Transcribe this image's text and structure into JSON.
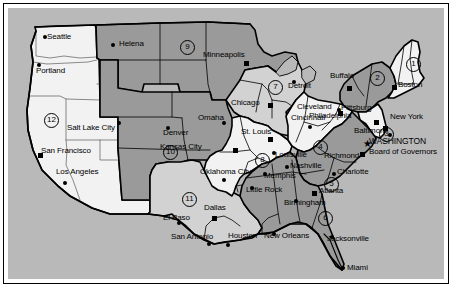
{
  "map": {
    "title": "Federal Reserve Districts of the United States",
    "colors": {
      "background": "#b9b9b9",
      "light_fill": "#f2f2f2",
      "mid_fill": "#d2d2d2",
      "dark_fill": "#9a9a9a",
      "outline": "#000000",
      "text": "#000000"
    },
    "districts": [
      {
        "number": "1",
        "x": 406,
        "y": 57,
        "name": "district-1-boston"
      },
      {
        "number": "2",
        "x": 370,
        "y": 71,
        "name": "district-2-new-york"
      },
      {
        "number": "3",
        "x": 379,
        "y": 127,
        "name": "district-3-philadelphia"
      },
      {
        "number": "4",
        "x": 313,
        "y": 140,
        "name": "district-4-cleveland"
      },
      {
        "number": "5",
        "x": 324,
        "y": 177,
        "name": "district-5-richmond"
      },
      {
        "number": "6",
        "x": 318,
        "y": 211,
        "name": "district-6-atlanta"
      },
      {
        "number": "7",
        "x": 268,
        "y": 80,
        "name": "district-7-chicago"
      },
      {
        "number": "8",
        "x": 255,
        "y": 153,
        "name": "district-8-st-louis"
      },
      {
        "number": "9",
        "x": 180,
        "y": 40,
        "name": "district-9-minneapolis"
      },
      {
        "number": "10",
        "x": 163,
        "y": 145,
        "name": "district-10-kansas-city"
      },
      {
        "number": "11",
        "x": 182,
        "y": 192,
        "name": "district-11-dallas"
      },
      {
        "number": "12",
        "x": 44,
        "y": 113,
        "name": "district-12-san-francisco"
      }
    ],
    "reserve_bank_cities": [
      {
        "label": "Boston",
        "lx": 398,
        "ly": 85,
        "mx": 392,
        "my": 85,
        "marker": "square",
        "anchor": "left"
      },
      {
        "label": "New York",
        "lx": 390,
        "ly": 117,
        "mx": 383,
        "my": 126,
        "marker": "square",
        "anchor": "left"
      },
      {
        "label": "Philadelphia",
        "lx": 309,
        "ly": 116,
        "mx": 374,
        "my": 120,
        "marker": "square",
        "anchor": "left"
      },
      {
        "label": "Cleveland",
        "lx": 297,
        "ly": 107,
        "mx": 338,
        "my": 111,
        "marker": "square",
        "anchor": "left"
      },
      {
        "label": "Richmond",
        "lx": 324,
        "ly": 156,
        "mx": 360,
        "my": 152,
        "marker": "square",
        "anchor": "left"
      },
      {
        "label": "Atlanta",
        "lx": 319,
        "ly": 191,
        "mx": 312,
        "my": 191,
        "marker": "square",
        "anchor": "left"
      },
      {
        "label": "Chicago",
        "lx": 231,
        "ly": 100,
        "mx": 268,
        "my": 103,
        "marker": "square",
        "anchor": "left"
      },
      {
        "label": "St. Louis",
        "lx": 241,
        "ly": 132,
        "mx": 268,
        "my": 137,
        "marker": "square",
        "anchor": "left"
      },
      {
        "label": "Minneapolis",
        "lx": 203,
        "ly": 54,
        "mx": 244,
        "my": 61,
        "marker": "square",
        "anchor": "left"
      },
      {
        "label": "Kansas City",
        "lx": 160,
        "ly": 146,
        "mx": 233,
        "my": 148,
        "marker": "square",
        "anchor": "left"
      },
      {
        "label": "Dallas",
        "lx": 204,
        "ly": 208,
        "mx": 212,
        "my": 216,
        "marker": "square",
        "anchor": "left"
      },
      {
        "label": "San Francisco",
        "lx": 41,
        "ly": 150,
        "mx": 38,
        "my": 153,
        "marker": "square",
        "anchor": "left"
      }
    ],
    "other_cities": [
      {
        "label": "Seattle",
        "lx": 47,
        "ly": 37,
        "mx": 43,
        "my": 35,
        "marker": "dot"
      },
      {
        "label": "Portland",
        "lx": 36,
        "ly": 71,
        "mx": 37,
        "my": 63,
        "marker": "dot"
      },
      {
        "label": "Helena",
        "lx": 119,
        "ly": 44,
        "mx": 111,
        "my": 43,
        "marker": "dot"
      },
      {
        "label": "Salt Lake City",
        "lx": 67,
        "ly": 128,
        "mx": 117,
        "my": 121,
        "marker": "dot"
      },
      {
        "label": "Los Angeles",
        "lx": 56,
        "ly": 172,
        "mx": 63,
        "my": 181,
        "marker": "dot"
      },
      {
        "label": "Denver",
        "lx": 163,
        "ly": 133,
        "mx": 166,
        "my": 126,
        "marker": "dot"
      },
      {
        "label": "Omaha",
        "lx": 198,
        "ly": 117,
        "mx": 222,
        "my": 121,
        "marker": "dot"
      },
      {
        "label": "Detroit",
        "lx": 288,
        "ly": 86,
        "mx": 292,
        "my": 80,
        "marker": "dot"
      },
      {
        "label": "Buffalo",
        "lx": 330,
        "ly": 76,
        "mx": 347,
        "my": 86,
        "marker": "square"
      },
      {
        "label": "Pittsburg",
        "lx": 341,
        "ly": 108,
        "mx": 337,
        "my": 108,
        "marker": "dot"
      },
      {
        "label": "Baltimore",
        "lx": 354,
        "ly": 131,
        "mx": 388,
        "my": 133,
        "marker": "dot"
      },
      {
        "label": "Cincinnati",
        "lx": 291,
        "ly": 118,
        "mx": 308,
        "my": 125,
        "marker": "dot"
      },
      {
        "label": "Louisville",
        "lx": 275,
        "ly": 155,
        "mx": 272,
        "my": 151,
        "marker": "dot"
      },
      {
        "label": "Nashville",
        "lx": 290,
        "ly": 166,
        "mx": 285,
        "my": 165,
        "marker": "dot"
      },
      {
        "label": "Charlotte",
        "lx": 337,
        "ly": 172,
        "mx": 332,
        "my": 172,
        "marker": "dot"
      },
      {
        "label": "Memphis",
        "lx": 264,
        "ly": 176,
        "mx": 263,
        "my": 172,
        "marker": "dot"
      },
      {
        "label": "Little Rock",
        "lx": 246,
        "ly": 190,
        "mx": 250,
        "my": 186,
        "marker": "dot"
      },
      {
        "label": "Birmingham",
        "lx": 284,
        "ly": 203,
        "mx": 294,
        "my": 199,
        "marker": "dot"
      },
      {
        "label": "Oklahoma City",
        "lx": 200,
        "ly": 172,
        "mx": 222,
        "my": 178,
        "marker": "dot"
      },
      {
        "label": "El Paso",
        "lx": 163,
        "ly": 218,
        "mx": 177,
        "my": 221,
        "marker": "dot"
      },
      {
        "label": "San Antonio",
        "lx": 171,
        "ly": 237,
        "mx": 207,
        "my": 242,
        "marker": "dot"
      },
      {
        "label": "Houston",
        "lx": 228,
        "ly": 236,
        "mx": 226,
        "my": 243,
        "marker": "dot"
      },
      {
        "label": "New Orleans",
        "lx": 264,
        "ly": 236,
        "mx": 272,
        "my": 232,
        "marker": "dot"
      },
      {
        "label": "Jacksonville",
        "lx": 327,
        "ly": 239,
        "mx": 330,
        "my": 235,
        "marker": "dot"
      },
      {
        "label": "Miami",
        "lx": 347,
        "ly": 268,
        "mx": 341,
        "my": 266,
        "marker": "dot"
      }
    ],
    "special_labels": [
      {
        "label": "WASHINGTON",
        "lx": 369,
        "ly": 141,
        "name": "washington-label"
      },
      {
        "label": "Board of Governors",
        "lx": 369,
        "ly": 151,
        "name": "board-of-governors-label"
      }
    ],
    "washington_star": {
      "x": 363,
      "y": 139,
      "glyph": "★"
    }
  }
}
